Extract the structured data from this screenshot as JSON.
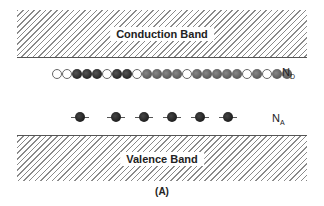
{
  "conduction_band": {
    "label": "Conduction Band"
  },
  "valence_band": {
    "label": "Valence Band"
  },
  "donor_level": {
    "label_main": "N",
    "label_sub": "D",
    "states": [
      "empty",
      "empty",
      "dark",
      "dark",
      "dark",
      "empty",
      "dark",
      "dark",
      "empty",
      "gray",
      "gray",
      "gray",
      "gray",
      "empty",
      "gray",
      "gray",
      "gray",
      "gray",
      "gray",
      "empty",
      "gray",
      "empty",
      "gray",
      "gray"
    ]
  },
  "acceptor_level": {
    "label_main": "N",
    "label_sub": "A",
    "positions": [
      80,
      116,
      144,
      172,
      200,
      228
    ]
  },
  "caption": "(A)"
}
